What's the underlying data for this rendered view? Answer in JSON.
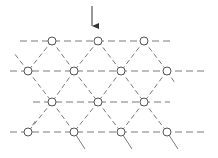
{
  "diagram": {
    "type": "triangular-lattice",
    "colors": {
      "line": "#7a7a7a",
      "node_stroke": "#555555",
      "node_fill": "#ffffff",
      "arrow": "#333333"
    },
    "arrow": {
      "x": 92,
      "y1": 6,
      "y2": 33
    },
    "rows": [
      {
        "y": 41,
        "x_start": 20,
        "x_end": 170,
        "nodes": [
          52,
          98,
          144
        ]
      },
      {
        "y": 71,
        "x_start": 10,
        "x_end": 208,
        "nodes": [
          28,
          74,
          121,
          167
        ]
      },
      {
        "y": 102,
        "x_start": 33,
        "x_end": 170,
        "nodes": [
          52,
          98,
          144
        ]
      },
      {
        "y": 132,
        "x_start": 10,
        "x_end": 208,
        "nodes": [
          28,
          74,
          121,
          167
        ]
      }
    ],
    "node_radius": 4
  }
}
